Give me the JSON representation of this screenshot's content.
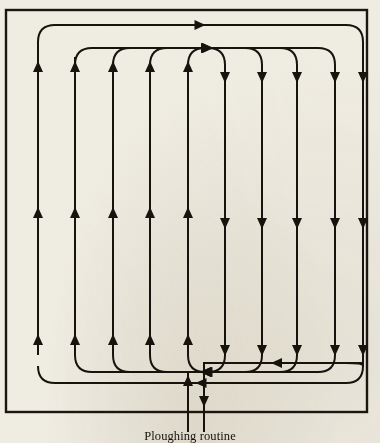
{
  "figure": {
    "caption": "Ploughing routine",
    "alt_name": "ploughing-routine-diagram",
    "colors": {
      "paper": "#efece2",
      "ink": "#17140e",
      "frame": "#1b1710"
    },
    "frame": {
      "x": 6,
      "y": 10,
      "width": 361,
      "height": 402,
      "stroke_width": 2.4
    },
    "path": {
      "type": "boustrophedon",
      "stroke_width": 2.0,
      "lane_count": 10,
      "lane_x": [
        38,
        75,
        113,
        150,
        188,
        225,
        262,
        297,
        335,
        363
      ],
      "lane_direction": [
        "up",
        "up",
        "up",
        "up",
        "up",
        "down",
        "down",
        "down",
        "down",
        "down"
      ],
      "top_y": [
        25,
        40,
        48,
        48,
        48,
        48,
        48,
        48,
        48,
        25
      ],
      "bottom_y": [
        372,
        372,
        372,
        372,
        372,
        372,
        372,
        372,
        372,
        383
      ],
      "turn_radius": 17,
      "mid_arrow_rows": [
        72,
        218,
        345
      ]
    },
    "entry": {
      "label": "entry",
      "x": 188,
      "from_y": 432,
      "to_y": 372,
      "arrow_y": 386,
      "direction": "up"
    },
    "exit": {
      "label": "exit",
      "x": 204,
      "from_y": 363,
      "to_y": 432,
      "arrow_y": 396,
      "direction": "down",
      "elbow_x": 363,
      "elbow_y": 363,
      "elbow_arrow_x": 282
    },
    "arrow_head": {
      "length": 11,
      "half_width": 5
    }
  }
}
